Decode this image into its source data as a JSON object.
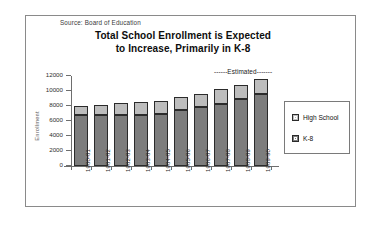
{
  "source_note": "Source:  Board of Education",
  "title_line1": "Total School Enrollment is Expected",
  "title_line2": "to Increase, Primarily in K-8",
  "annotation": "------Estimated-------",
  "legend": {
    "items": [
      {
        "label": "High School",
        "color": "#bdbdbd"
      },
      {
        "label": "K-8",
        "color": "#7d7d7d"
      }
    ]
  },
  "chart_data": {
    "type": "bar",
    "stacked": true,
    "title": "Total School Enrollment is Expected to Increase, Primarily in K-8",
    "xlabel": "",
    "ylabel": "Enrollment",
    "ylim": [
      0,
      12000
    ],
    "yticks": [
      0,
      2000,
      4000,
      6000,
      8000,
      10000,
      12000
    ],
    "ytick_labels": [
      "0",
      "2000",
      "4000",
      "6000",
      "8000",
      "10000",
      "12000"
    ],
    "grid": false,
    "legend_position": "right",
    "categories": [
      "1980-81",
      "1981-82",
      "1982-83",
      "1983-84",
      "1984-85",
      "1985-86",
      "1986-87",
      "1987-88",
      "1988-89",
      "1989-90"
    ],
    "series": [
      {
        "name": "K-8",
        "color": "#7d7d7d",
        "values": [
          6750,
          6750,
          6750,
          6850,
          6950,
          7450,
          7900,
          8250,
          8950,
          9600
        ]
      },
      {
        "name": "High School",
        "color": "#bdbdbd",
        "values": [
          1250,
          1450,
          1650,
          1750,
          1750,
          1800,
          1750,
          2050,
          1900,
          2000
        ]
      }
    ],
    "totals": [
      8000,
      8200,
      8400,
      8600,
      8700,
      9250,
      9650,
      10300,
      10850,
      11600
    ],
    "annotations": [
      {
        "text": "------Estimated-------",
        "applies_to": [
          "1987-88",
          "1988-89",
          "1989-90"
        ]
      }
    ],
    "source": "Source:  Board of Education"
  }
}
